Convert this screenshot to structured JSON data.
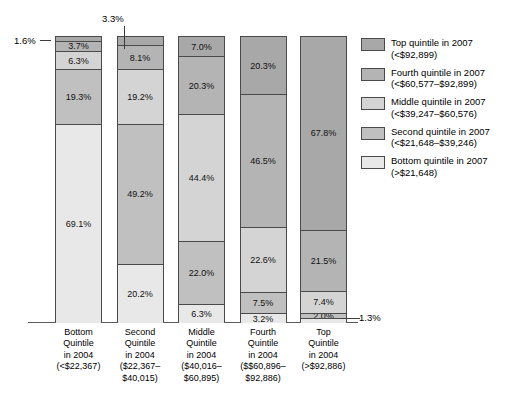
{
  "chart_data": {
    "type": "bar",
    "subtype": "stacked-percent",
    "title": "",
    "xlabel": "",
    "ylabel": "",
    "ylim": [
      0,
      100
    ],
    "grid": false,
    "legend_position": "right",
    "categories": [
      "Bottom Quintile in 2004 (<$22,367)",
      "Second Quintile in 2004 ($22,367–$40,015)",
      "Middle Quintile in 2004 ($40,016–$60,895)",
      "Fourth Quintile in 2004 ($$60,896–$92,886)",
      "Top Quintile in 2004 (>$92,886)"
    ],
    "series": [
      {
        "name": "Top quintile in 2007 (<$92,899)",
        "values": [
          1.6,
          3.3,
          7.0,
          20.3,
          67.8
        ]
      },
      {
        "name": "Fourth quintile in 2007 (<$60,577–$92,899)",
        "values": [
          3.7,
          8.1,
          20.3,
          46.5,
          21.5
        ]
      },
      {
        "name": "Middle quintile in 2007 (<$39,247–$60,576)",
        "values": [
          6.3,
          19.2,
          44.4,
          22.6,
          7.4
        ]
      },
      {
        "name": "Second quintile in 2007 (<$21,648–$39,246)",
        "values": [
          19.3,
          49.2,
          22.0,
          7.5,
          2.0
        ]
      },
      {
        "name": "Bottom quintile in 2007 (>$21,648)",
        "values": [
          69.1,
          20.2,
          6.3,
          3.2,
          1.3
        ]
      }
    ],
    "colors": {
      "top_quintile": "#a8a8a8",
      "fourth_quintile": "#b4b4b4",
      "middle_quintile": "#d4d4d4",
      "second_quintile": "#c0c0c0",
      "bottom_quintile": "#e8e8e8",
      "outline": "#4a4a4a"
    }
  },
  "bars": [
    {
      "key": "bottom-quintile-2004",
      "segments": [
        {
          "label": "1.6%",
          "value": 1.6,
          "inline": false,
          "color": "#a8a8a8"
        },
        {
          "label": "3.7%",
          "value": 3.7,
          "inline": true,
          "color": "#b4b4b4"
        },
        {
          "label": "6.3%",
          "value": 6.3,
          "inline": true,
          "color": "#d4d4d4"
        },
        {
          "label": "19.3%",
          "value": 19.3,
          "inline": true,
          "color": "#c0c0c0"
        },
        {
          "label": "69.1%",
          "value": 69.1,
          "inline": true,
          "color": "#e8e8e8"
        }
      ]
    },
    {
      "key": "second-quintile-2004",
      "segments": [
        {
          "label": "3.3%",
          "value": 3.3,
          "inline": false,
          "color": "#a8a8a8"
        },
        {
          "label": "8.1%",
          "value": 8.1,
          "inline": true,
          "color": "#b4b4b4"
        },
        {
          "label": "19.2%",
          "value": 19.2,
          "inline": true,
          "color": "#d4d4d4"
        },
        {
          "label": "49.2%",
          "value": 49.2,
          "inline": true,
          "color": "#c0c0c0"
        },
        {
          "label": "20.2%",
          "value": 20.2,
          "inline": true,
          "color": "#e8e8e8"
        }
      ]
    },
    {
      "key": "middle-quintile-2004",
      "segments": [
        {
          "label": "7.0%",
          "value": 7.0,
          "inline": true,
          "color": "#a8a8a8"
        },
        {
          "label": "20.3%",
          "value": 20.3,
          "inline": true,
          "color": "#b4b4b4"
        },
        {
          "label": "44.4%",
          "value": 44.4,
          "inline": true,
          "color": "#d4d4d4"
        },
        {
          "label": "22.0%",
          "value": 22.0,
          "inline": true,
          "color": "#c0c0c0"
        },
        {
          "label": "6.3%",
          "value": 6.3,
          "inline": true,
          "color": "#e8e8e8"
        }
      ]
    },
    {
      "key": "fourth-quintile-2004",
      "segments": [
        {
          "label": "20.3%",
          "value": 20.3,
          "inline": true,
          "color": "#a8a8a8"
        },
        {
          "label": "46.5%",
          "value": 46.5,
          "inline": true,
          "color": "#b4b4b4"
        },
        {
          "label": "22.6%",
          "value": 22.6,
          "inline": true,
          "color": "#d4d4d4"
        },
        {
          "label": "7.5%",
          "value": 7.5,
          "inline": true,
          "color": "#c0c0c0"
        },
        {
          "label": "3.2%",
          "value": 3.2,
          "inline": true,
          "color": "#e8e8e8"
        }
      ]
    },
    {
      "key": "top-quintile-2004",
      "segments": [
        {
          "label": "67.8%",
          "value": 67.8,
          "inline": true,
          "color": "#a8a8a8"
        },
        {
          "label": "21.5%",
          "value": 21.5,
          "inline": true,
          "color": "#b4b4b4"
        },
        {
          "label": "7.4%",
          "value": 7.4,
          "inline": true,
          "color": "#d4d4d4"
        },
        {
          "label": "2.0%",
          "value": 2.0,
          "inline": true,
          "color": "#c0c0c0"
        },
        {
          "label": "1.3%",
          "value": 1.3,
          "inline": false,
          "color": "#e8e8e8"
        }
      ]
    }
  ],
  "callouts": [
    {
      "key": "callout-1-6",
      "label": "1.6%",
      "left": 14,
      "top": 35,
      "side": "left"
    },
    {
      "key": "callout-3-3",
      "label": "3.3%",
      "left": 102,
      "top": 13,
      "side": "top"
    },
    {
      "key": "callout-1-3",
      "label": "1.3%",
      "left": 359,
      "top": 312,
      "side": "right"
    }
  ],
  "x_axis": {
    "labels": [
      {
        "lines": [
          "Bottom",
          "Quintile",
          "in 2004",
          "(<$22,367)"
        ]
      },
      {
        "lines": [
          "Second",
          "Quintile",
          "in 2004",
          "($22,367–",
          "$40,015)"
        ]
      },
      {
        "lines": [
          "Middle",
          "Quintile",
          "in 2004",
          "($40,016–",
          "$60,895)"
        ]
      },
      {
        "lines": [
          "Fourth",
          "Quintile",
          "in 2004",
          "($$60,896–",
          "$92,886)"
        ]
      },
      {
        "lines": [
          "Top",
          "Quintile",
          "in 2004",
          "(>$92,886)"
        ]
      }
    ]
  },
  "legend": {
    "items": [
      {
        "key": "legend-top-quintile",
        "color": "#a8a8a8",
        "line1": "Top quintile in 2007",
        "line2": "(<$92,899)"
      },
      {
        "key": "legend-fourth-quintile",
        "color": "#b4b4b4",
        "line1": "Fourth quintile in 2007",
        "line2": "(<$60,577–$92,899)"
      },
      {
        "key": "legend-middle-quintile",
        "color": "#d4d4d4",
        "line1": "Middle quintile in 2007",
        "line2": "(<$39,247–$60,576)"
      },
      {
        "key": "legend-second-quintile",
        "color": "#c0c0c0",
        "line1": "Second quintile in 2007",
        "line2": "(<$21,648–$39,246)"
      },
      {
        "key": "legend-bottom-quintile",
        "color": "#e8e8e8",
        "line1": "Bottom quintile in 2007",
        "line2": "(>$21,648)"
      }
    ]
  }
}
